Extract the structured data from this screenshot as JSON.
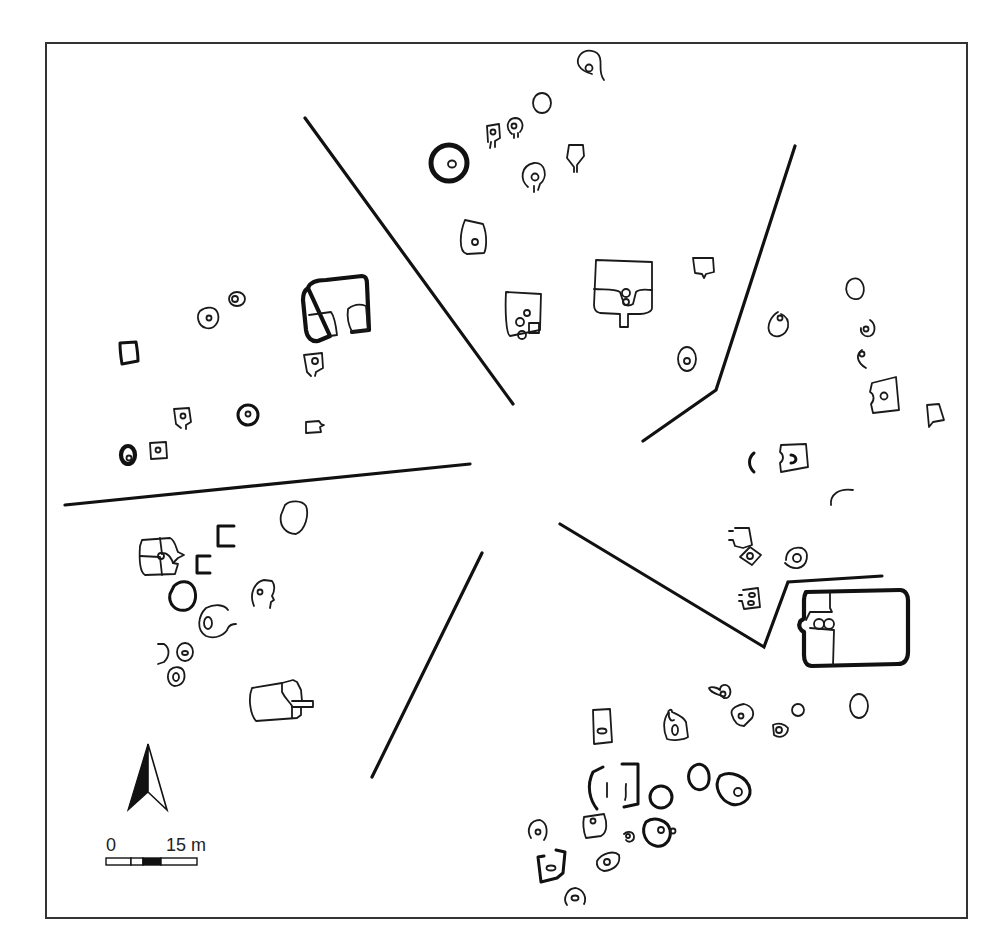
{
  "figure": {
    "type": "archaeological site plan",
    "frame": {
      "x": 46,
      "y": 43,
      "width": 921,
      "height": 875,
      "stroke": "#333333"
    },
    "ink_color": "#111111",
    "background": "#ffffff"
  },
  "legend": {
    "north_arrow": {
      "icon": "north-arrow-icon"
    },
    "scale_bar": {
      "start_label": "0",
      "end_label": "15 m",
      "segments": [
        "white",
        "white",
        "black",
        "white"
      ]
    }
  },
  "dividing_lines": [
    {
      "name": "northwest-divider",
      "points": [
        [
          305,
          118
        ],
        [
          513,
          404
        ]
      ]
    },
    {
      "name": "northeast-divider",
      "points": [
        [
          795,
          146
        ],
        [
          716,
          390
        ],
        [
          643,
          441
        ]
      ]
    },
    {
      "name": "west-divider",
      "points": [
        [
          65,
          505
        ],
        [
          470,
          464
        ]
      ]
    },
    {
      "name": "southwest-divider",
      "points": [
        [
          482,
          553
        ],
        [
          372,
          777
        ]
      ]
    },
    {
      "name": "southeast-divider",
      "points": [
        [
          560,
          524
        ],
        [
          764,
          647
        ],
        [
          788,
          582
        ],
        [
          882,
          576
        ]
      ]
    }
  ],
  "sectors": [
    "north",
    "east",
    "southeast",
    "south-west",
    "west",
    "north-west"
  ]
}
